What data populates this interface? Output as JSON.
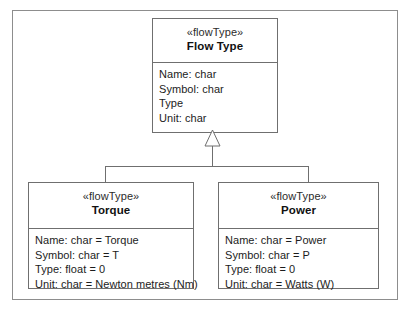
{
  "diagram": {
    "type": "uml-class-diagram",
    "relationship": "generalization",
    "stereotype": "«flowType»",
    "parent": {
      "stereotype": "«flowType»",
      "name": "Flow Type",
      "attributes": [
        "Name: char",
        "Symbol: char",
        "Type",
        "Unit: char"
      ]
    },
    "children": [
      {
        "stereotype": "«flowType»",
        "name": "Torque",
        "attributes": [
          "Name: char = Torque",
          "Symbol: char = T",
          "Type: float = 0",
          "Unit: char = Newton metres (Nm)"
        ]
      },
      {
        "stereotype": "«flowType»",
        "name": "Power",
        "attributes": [
          "Name: char = Power",
          "Symbol: char = P",
          "Type: float = 0",
          "Unit: char = Watts (W)"
        ]
      }
    ]
  },
  "colors": {
    "background": "#ffffff",
    "box_border": "#6f6f6f",
    "frame_border": "#8d8d8d",
    "text": "#1c1c1c"
  }
}
